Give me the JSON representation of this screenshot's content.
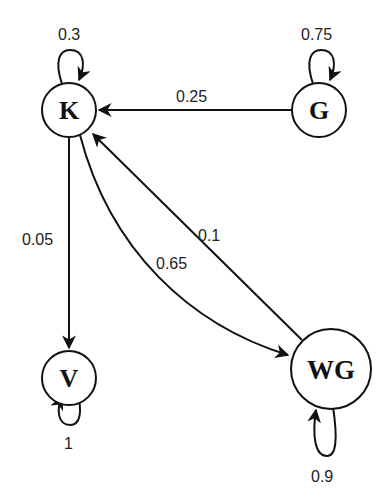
{
  "diagram": {
    "type": "state-transition",
    "nodes": [
      {
        "id": "K",
        "label": "K"
      },
      {
        "id": "G",
        "label": "G"
      },
      {
        "id": "V",
        "label": "V"
      },
      {
        "id": "WG",
        "label": "WG"
      }
    ],
    "edges": [
      {
        "from": "K",
        "to": "K",
        "label": "0.3"
      },
      {
        "from": "G",
        "to": "G",
        "label": "0.75"
      },
      {
        "from": "G",
        "to": "K",
        "label": "0.25"
      },
      {
        "from": "K",
        "to": "V",
        "label": "0.05"
      },
      {
        "from": "K",
        "to": "WG",
        "label": "0.65"
      },
      {
        "from": "WG",
        "to": "K",
        "label": "0.1"
      },
      {
        "from": "V",
        "to": "V",
        "label": "1"
      },
      {
        "from": "WG",
        "to": "WG",
        "label": "0.9"
      }
    ]
  }
}
